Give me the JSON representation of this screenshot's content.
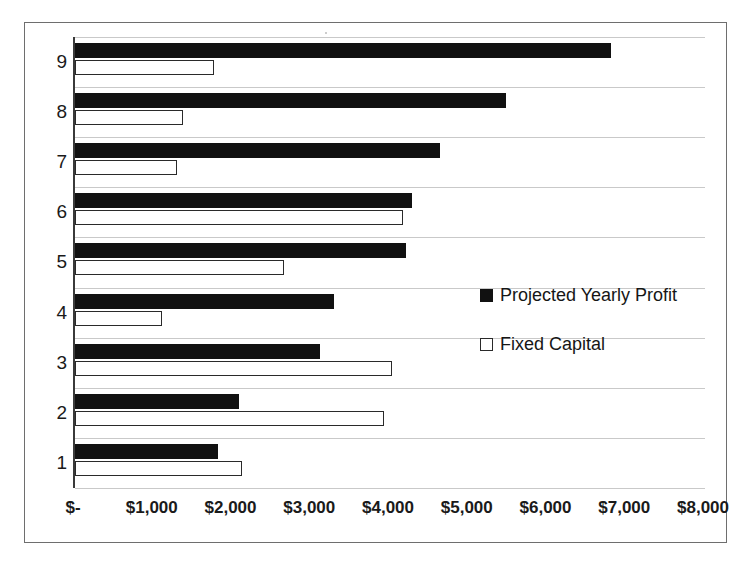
{
  "chart_data": {
    "type": "bar",
    "orientation": "horizontal",
    "title": "",
    "xlabel": "",
    "ylabel": "",
    "categories": [
      "1",
      "2",
      "3",
      "4",
      "5",
      "6",
      "7",
      "8",
      "9"
    ],
    "xlim": [
      0,
      8000
    ],
    "xticks": [
      0,
      1000,
      2000,
      3000,
      4000,
      5000,
      6000,
      7000,
      8000
    ],
    "xtick_labels": [
      "$-",
      "$1,000",
      "$2,000",
      "$3,000",
      "$4,000",
      "$5,000",
      "$6,000",
      "$7,000",
      "$8,000"
    ],
    "grid": false,
    "legend_position": "center-right",
    "series": [
      {
        "name": "Projected Yearly Profit",
        "color": "#111111",
        "style": "filled",
        "values": [
          1810,
          2080,
          3110,
          3290,
          4200,
          4280,
          4640,
          5470,
          6800
        ]
      },
      {
        "name": "Fixed Capital",
        "color": "#ffffff",
        "style": "hollow",
        "values": [
          2120,
          3920,
          4020,
          1110,
          2650,
          4170,
          1290,
          1370,
          1760
        ]
      }
    ]
  },
  "legend": {
    "items": [
      {
        "label": "Projected Yearly Profit",
        "swatch": "filled-square-icon"
      },
      {
        "label": "Fixed Capital",
        "swatch": "hollow-square-icon"
      }
    ]
  },
  "axis": {
    "y_labels": [
      "9",
      "8",
      "7",
      "6",
      "5",
      "4",
      "3",
      "2",
      "1"
    ],
    "x_labels": [
      "$-",
      "$1,000",
      "$2,000",
      "$3,000",
      "$4,000",
      "$5,000",
      "$6,000",
      "$7,000",
      "$8,000"
    ]
  },
  "colors": {
    "series_profit": "#111111",
    "series_capital": "#ffffff",
    "outline": "#2a2a2a",
    "frame": "#6e6e6e",
    "gridline": "#c9c9c9",
    "text": "#1a1a1a",
    "background": "#ffffff"
  }
}
